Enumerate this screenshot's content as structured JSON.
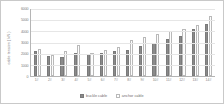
{
  "chart_data": {
    "type": "bar",
    "title": "",
    "xlabel": "",
    "ylabel": "cable tension ( kN )",
    "ylim": [
      0,
      6000
    ],
    "yticks": [
      6000,
      5000,
      4000,
      3000,
      2000,
      1000,
      0
    ],
    "grid": false,
    "legend_position": "bottom",
    "categories": [
      "1#",
      "2#",
      "3#",
      "4#",
      "5#",
      "6#",
      "7#",
      "8#",
      "9#",
      "10#",
      "11#",
      "12#",
      "13#",
      "14#"
    ],
    "series": [
      {
        "name": "buckle cable",
        "color": "#8a8a8a",
        "values": [
          2250,
          1750,
          1720,
          2100,
          1950,
          2050,
          2250,
          2350,
          2700,
          2950,
          3300,
          3550,
          4250,
          4700
        ]
      },
      {
        "name": "anchor cable",
        "color": "#ffffff",
        "values": [
          2450,
          1850,
          2250,
          2750,
          2050,
          2350,
          2600,
          3200,
          3500,
          3800,
          4000,
          4250,
          4600,
          5400
        ]
      }
    ]
  }
}
